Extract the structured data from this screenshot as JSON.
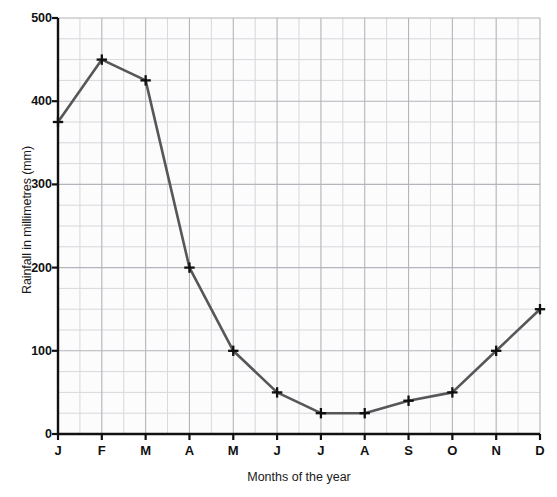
{
  "chart_data": {
    "type": "line",
    "title": "",
    "xlabel": "Months of the year",
    "ylabel": "Rainfall in millimetres (mm)",
    "categories": [
      "J",
      "F",
      "M",
      "A",
      "M",
      "J",
      "J",
      "A",
      "S",
      "O",
      "N",
      "D"
    ],
    "category_names": [
      "January",
      "February",
      "March",
      "April",
      "May",
      "June",
      "July",
      "August",
      "September",
      "October",
      "November",
      "December"
    ],
    "values": [
      375,
      450,
      425,
      200,
      100,
      50,
      25,
      25,
      40,
      50,
      100,
      150
    ],
    "ylim": [
      0,
      500
    ],
    "y_ticks": [
      0,
      100,
      200,
      300,
      400,
      500
    ],
    "y_tick_labels": [
      "0",
      "100",
      "200",
      "300",
      "400",
      "500"
    ],
    "y_minor_step": 25,
    "grid": true,
    "legend": "none",
    "marker": "plus-cross",
    "line_color": "#575759",
    "marker_color": "#101010",
    "grid_major_color": "#b4b4ba",
    "grid_minor_color": "#d8d8dd",
    "axis_color": "#111111",
    "plot_background": "#fcfcfc"
  },
  "axis": {
    "y_title": "Rainfall in millimetres (mm)",
    "x_title": "Months of the year"
  }
}
